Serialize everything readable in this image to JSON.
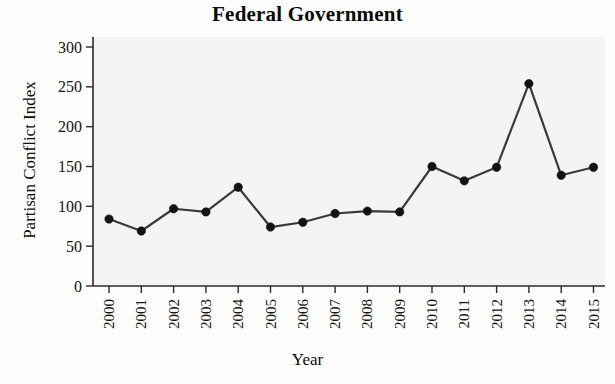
{
  "chart_data": {
    "type": "line",
    "title": "Federal Government",
    "xlabel": "Year",
    "ylabel": "Partisan Conflict Index",
    "categories": [
      "2000",
      "2001",
      "2002",
      "2003",
      "2004",
      "2005",
      "2006",
      "2007",
      "2008",
      "2009",
      "2010",
      "2011",
      "2012",
      "2013",
      "2014",
      "2015"
    ],
    "x": [
      2000,
      2001,
      2002,
      2003,
      2004,
      2005,
      2006,
      2007,
      2008,
      2009,
      2010,
      2011,
      2012,
      2013,
      2014,
      2015
    ],
    "values": [
      84,
      69,
      97,
      93,
      124,
      74,
      80,
      91,
      94,
      93,
      150,
      132,
      149,
      254,
      139,
      149
    ],
    "series": [
      {
        "name": "Partisan Conflict Index",
        "values": [
          84,
          69,
          97,
          93,
          124,
          74,
          80,
          91,
          94,
          93,
          150,
          132,
          149,
          254,
          139,
          149
        ]
      }
    ],
    "ylim": [
      0,
      300
    ],
    "yticks": [
      0,
      50,
      100,
      150,
      200,
      250,
      300
    ],
    "ytick_labels": [
      "0",
      "50",
      "100",
      "150",
      "200",
      "250",
      "300"
    ],
    "xtick_labels": [
      "2000",
      "2001",
      "2002",
      "2003",
      "2004",
      "2005",
      "2006",
      "2007",
      "2008",
      "2009",
      "2010",
      "2011",
      "2012",
      "2013",
      "2014",
      "2015"
    ],
    "xtick_rotation": 90,
    "grid": false,
    "legend": null,
    "marker": "filled-circle",
    "line_color": "#3a3a3a",
    "marker_color": "#131313",
    "plot_background": "#f4f4f4",
    "annotations": []
  }
}
